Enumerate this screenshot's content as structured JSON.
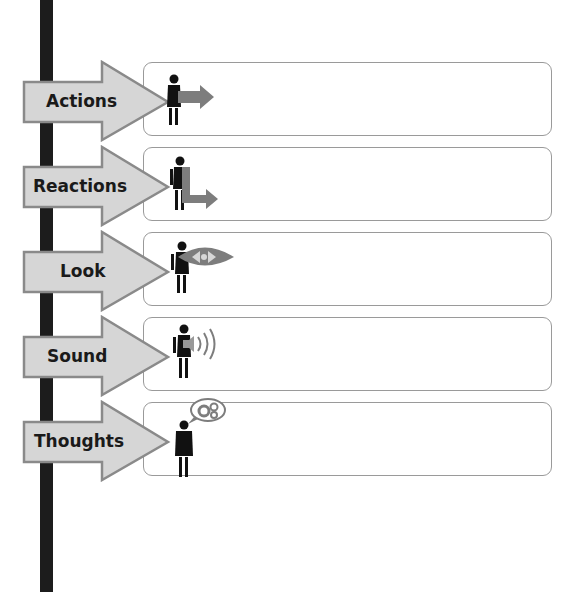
{
  "diagram": {
    "title": "",
    "colors": {
      "bar": "#1c1c1c",
      "arrow_fill": "#d6d6d6",
      "arrow_border": "#8a8a8a",
      "icon_gray": "#7d7d7d",
      "box_border": "#9a9a9a"
    },
    "rows": [
      {
        "label": "Actions",
        "icon": "person-with-arrow-icon",
        "content": ""
      },
      {
        "label": "Reactions",
        "icon": "person-with-return-arrow-icon",
        "content": ""
      },
      {
        "label": "Look",
        "icon": "person-with-eye-icon",
        "content": ""
      },
      {
        "label": "Sound",
        "icon": "person-with-speaker-icon",
        "content": ""
      },
      {
        "label": "Thoughts",
        "icon": "person-with-thought-gears-icon",
        "content": ""
      }
    ]
  }
}
